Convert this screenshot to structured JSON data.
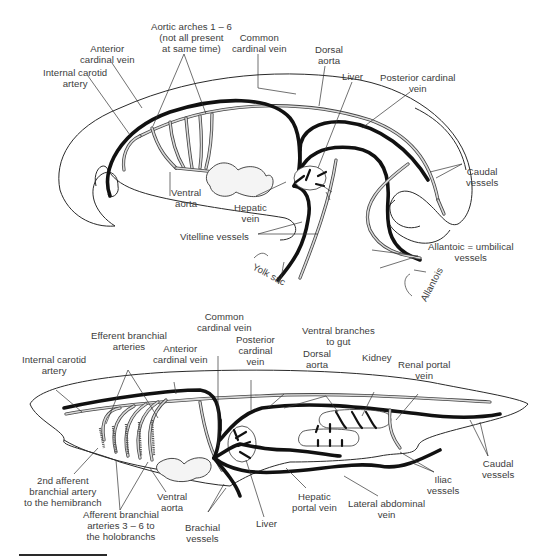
{
  "figure": {
    "top_diagram": {
      "subject": "embryo circulatory system",
      "labels": {
        "internal_carotid": [
          "Internal carotid",
          "artery"
        ],
        "anterior_cardinal": [
          "Anterior",
          "cardinal vein"
        ],
        "aortic_arches": [
          "Aortic arches 1 – 6",
          "(not all present",
          "at same time)"
        ],
        "common_cardinal": [
          "Common",
          "cardinal vein"
        ],
        "dorsal_aorta": [
          "Dorsal",
          "aorta"
        ],
        "liver": "Liver",
        "posterior_cardinal": [
          "Posterior cardinal",
          "vein"
        ],
        "caudal_vessels": [
          "Caudal",
          "vessels"
        ],
        "ventral_aorta": [
          "Ventral",
          "aorta"
        ],
        "hepatic_vein": [
          "Hepatic",
          "vein"
        ],
        "vitelline_vessels": "Vitelline vessels",
        "yolk_sac": "Yolk sac",
        "allantoic": [
          "Allantoic = umbilical",
          "vessels"
        ],
        "allantois": "Allantois"
      }
    },
    "bottom_diagram": {
      "subject": "fish circulatory system",
      "labels": {
        "internal_carotid": [
          "Internal carotid",
          "artery"
        ],
        "efferent_branchial": [
          "Efferent branchial",
          "arteries"
        ],
        "anterior_cardinal": [
          "Anterior",
          "cardinal vein"
        ],
        "common_cardinal": [
          "Common",
          "cardinal vein"
        ],
        "posterior_cardinal": [
          "Posterior",
          "cardinal",
          "vein"
        ],
        "dorsal_aorta": [
          "Dorsal",
          "aorta"
        ],
        "ventral_branches": [
          "Ventral branches",
          "to gut"
        ],
        "kidney": "Kidney",
        "renal_portal": [
          "Renal portal",
          "vein"
        ],
        "caudal_vessels": [
          "Caudal",
          "vessels"
        ],
        "iliac_vessels": [
          "Iliac",
          "vessels"
        ],
        "second_afferent": [
          "2nd afferent",
          "branchial artery",
          "to the hemibranch"
        ],
        "afferent_3_6": [
          "Afferent branchial",
          "arteries 3 – 6 to",
          "the holobranchs"
        ],
        "ventral_aorta": [
          "Ventral",
          "aorta"
        ],
        "brachial_vessels": [
          "Brachial",
          "vessels"
        ],
        "liver": "Liver",
        "hepatic_portal": [
          "Hepatic",
          "portal vein"
        ],
        "lateral_abdominal": [
          "Lateral abdominal",
          "vein"
        ]
      }
    },
    "colors": {
      "vein": "#111111",
      "artery_outline": "#444444",
      "artery_fill": "#d8d8d8",
      "text": "#3c3c3c",
      "background": "#ffffff"
    }
  }
}
